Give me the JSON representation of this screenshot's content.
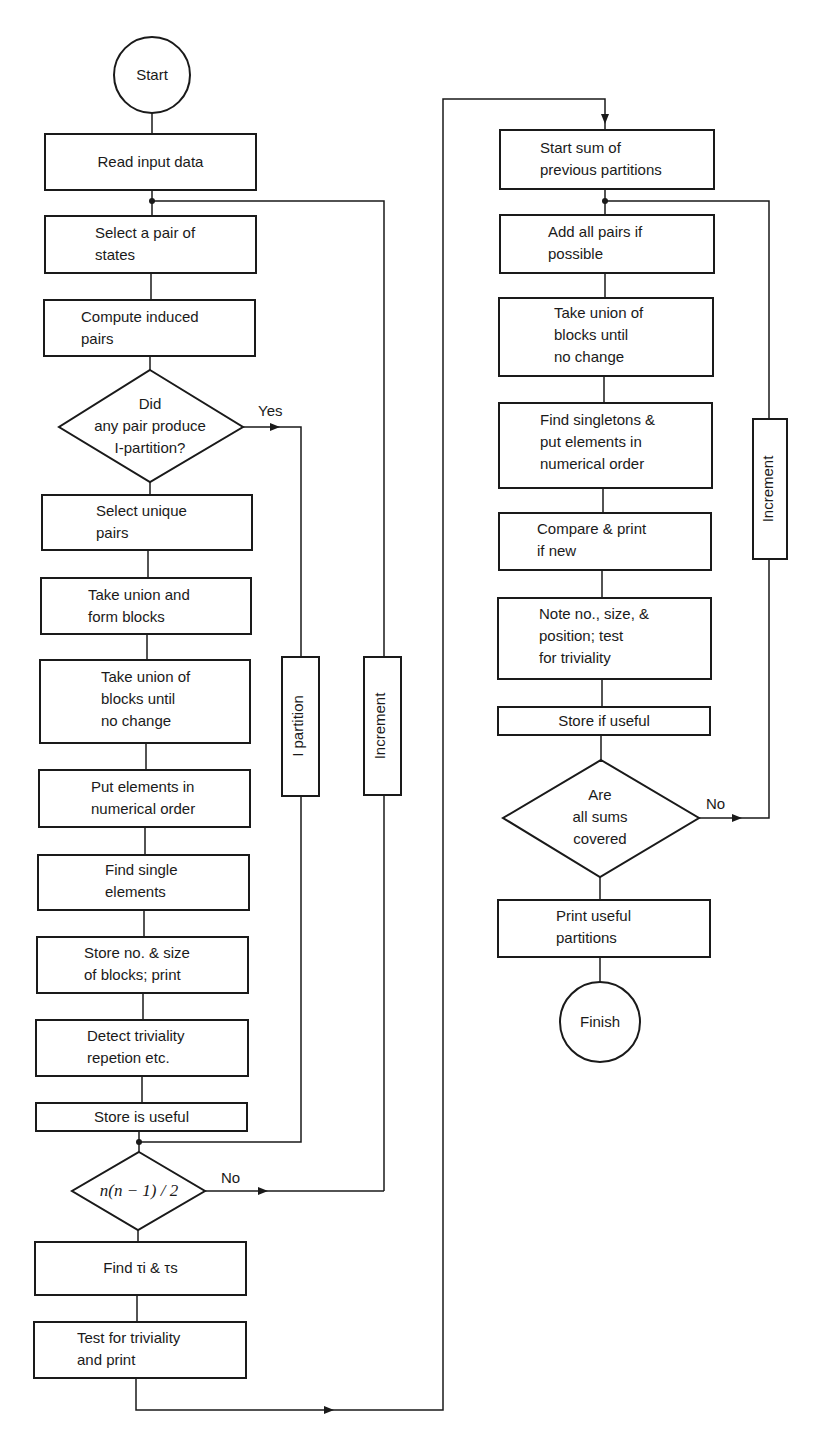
{
  "flowchart": {
    "left_column": {
      "start": "Start",
      "read_input": "Read input data",
      "select_pair": "Select a pair of\nstates",
      "compute_induced": "Compute induced\npairs",
      "decision_ipartition": "Did\nany pair produce\nI-partition?",
      "decision_yes": "Yes",
      "select_unique": "Select unique\npairs",
      "take_union_form": "Take union and\nform blocks",
      "take_union_blocks": "Take union of\nblocks until\nno change",
      "put_elements": "Put elements in\nnumerical order",
      "find_single": "Find single\nelements",
      "store_no_size": "Store no. & size\nof blocks; print",
      "detect_triviality": "Detect triviality\nrepetion etc.",
      "store_useful": "Store is useful",
      "decision_n": "n(n − 1) / 2",
      "decision_no": "No",
      "find_tau": "Find τi & τs",
      "test_triviality": "Test for triviality\nand print"
    },
    "loops": {
      "i_partition": "I partition",
      "increment_left": "Increment",
      "increment_right": "Increment"
    },
    "right_column": {
      "start_sum": "Start sum of\nprevious partitions",
      "add_pairs": "Add all pairs if\npossible",
      "take_union_blocks": "Take union of\nblocks until\nno change",
      "find_singletons": "Find singletons &\nput elements in\nnumerical order",
      "compare_print": "Compare & print\nif new",
      "note_no_size": "Note no., size, &\nposition; test\nfor triviality",
      "store_if_useful": "Store if useful",
      "decision_sums": "Are\nall sums\ncovered",
      "decision_no": "No",
      "print_useful": "Print useful\npartitions",
      "finish": "Finish"
    }
  },
  "colors": {
    "ink": "#1a1a1a",
    "background": "#ffffff"
  }
}
